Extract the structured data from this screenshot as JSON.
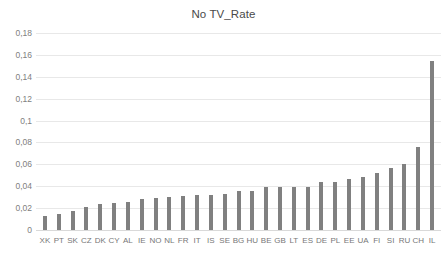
{
  "chart_data": {
    "type": "bar",
    "title": "No TV_Rate",
    "xlabel": "",
    "ylabel": "",
    "ylim": [
      0,
      0.18
    ],
    "ytick_labels": [
      "0,18",
      "0,16",
      "0,14",
      "0,12",
      "0,1",
      "0,08",
      "0,06",
      "0,04",
      "0,02",
      "0"
    ],
    "ytick_values": [
      0.18,
      0.16,
      0.14,
      0.12,
      0.1,
      0.08,
      0.06,
      0.04,
      0.02,
      0
    ],
    "grid": true,
    "legend": false,
    "bar_color": "#808080",
    "decimal_separator": ",",
    "categories": [
      "XK",
      "PT",
      "SK",
      "CZ",
      "DK",
      "CY",
      "AL",
      "IE",
      "NO",
      "NL",
      "FR",
      "IT",
      "IS",
      "SE",
      "BG",
      "HU",
      "BE",
      "GB",
      "LT",
      "ES",
      "DE",
      "PL",
      "EE",
      "UA",
      "FI",
      "SI",
      "RU",
      "CH",
      "IL"
    ],
    "values": [
      0.013,
      0.015,
      0.017,
      0.021,
      0.024,
      0.025,
      0.026,
      0.028,
      0.029,
      0.03,
      0.031,
      0.032,
      0.032,
      0.033,
      0.036,
      0.036,
      0.039,
      0.039,
      0.039,
      0.039,
      0.044,
      0.044,
      0.047,
      0.048,
      0.052,
      0.057,
      0.06,
      0.076,
      0.154
    ]
  }
}
